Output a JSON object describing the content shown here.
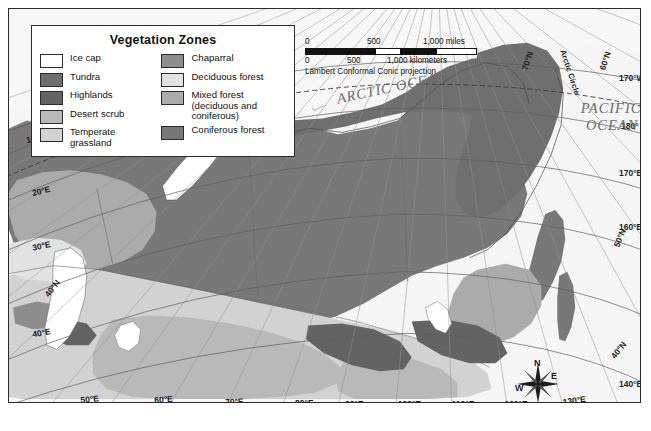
{
  "map": {
    "title": "Vegetation Zones",
    "projection_note": "Lambert Conformal Conic projection",
    "ocean_labels": [
      {
        "name": "arctic-ocean",
        "text": "ARCTIC OCEAN",
        "x": 330,
        "y": 95,
        "rotate": -12
      },
      {
        "name": "pacific-ocean-line1",
        "text": "PACIFIC",
        "x": 604,
        "y": 105,
        "rotate": 0
      },
      {
        "name": "pacific-ocean-line2",
        "text": "OCEAN",
        "x": 605,
        "y": 122,
        "rotate": 0
      }
    ],
    "arctic_circle_label": "Arctic Circle",
    "compass": {
      "north": "N",
      "east": "E",
      "south": "S",
      "west": "W"
    },
    "graticule_labels": [
      {
        "text": "10°E",
        "x": 18,
        "y": 135,
        "rotate": -14
      },
      {
        "text": "20°E",
        "x": 24,
        "y": 188,
        "rotate": -14
      },
      {
        "text": "30°E",
        "x": 24,
        "y": 243,
        "rotate": -12
      },
      {
        "text": "40°E",
        "x": 24,
        "y": 330,
        "rotate": -10
      },
      {
        "text": "40°N",
        "x": 40,
        "y": 290,
        "rotate": -52
      },
      {
        "text": "50°E",
        "x": 72,
        "y": 396,
        "rotate": -6
      },
      {
        "text": "60°E",
        "x": 146,
        "y": 396,
        "rotate": -4
      },
      {
        "text": "70°E",
        "x": 217,
        "y": 398,
        "rotate": -2
      },
      {
        "text": "80°E",
        "x": 287,
        "y": 399,
        "rotate": 0
      },
      {
        "text": "90°E",
        "x": 337,
        "y": 400,
        "rotate": 0
      },
      {
        "text": "100°E",
        "x": 390,
        "y": 400,
        "rotate": 0
      },
      {
        "text": "110°E",
        "x": 444,
        "y": 400,
        "rotate": 0
      },
      {
        "text": "120°E",
        "x": 497,
        "y": 400,
        "rotate": 0
      },
      {
        "text": "130°E",
        "x": 556,
        "y": 398,
        "rotate": -8
      },
      {
        "text": "140°E",
        "x": 612,
        "y": 380,
        "rotate": 0
      },
      {
        "text": "70°N",
        "x": 520,
        "y": 62,
        "rotate": -72
      },
      {
        "text": "170°W",
        "x": 612,
        "y": 72,
        "rotate": 0
      },
      {
        "text": "180°",
        "x": 614,
        "y": 121,
        "rotate": 0
      },
      {
        "text": "170°E",
        "x": 612,
        "y": 168,
        "rotate": 0
      },
      {
        "text": "160°E",
        "x": 612,
        "y": 222,
        "rotate": 0
      },
      {
        "text": "60°N",
        "x": 598,
        "y": 62,
        "rotate": -72
      },
      {
        "text": "50°N",
        "x": 612,
        "y": 240,
        "rotate": -68
      },
      {
        "text": "40°N",
        "x": 608,
        "y": 352,
        "rotate": -52
      }
    ]
  },
  "legend": {
    "title": "Vegetation Zones",
    "left_column": [
      {
        "label": "Ice cap",
        "color": "#ffffff"
      },
      {
        "label": "Tundra",
        "color": "#6f6f6f"
      },
      {
        "label": "Highlands",
        "color": "#636363"
      },
      {
        "label": "Desert scrub",
        "color": "#b9b9b9"
      },
      {
        "label": "Temperate grassland",
        "color": "#d2d2d2"
      }
    ],
    "right_column": [
      {
        "label": "Chaparral",
        "color": "#8d8d8d"
      },
      {
        "label": "Deciduous forest",
        "color": "#e2e2e2"
      },
      {
        "label": "Mixed forest\n(deciduous and coniferous)",
        "color": "#ababab"
      },
      {
        "label": "Coniferous forest",
        "color": "#787878"
      }
    ]
  },
  "scalebar": {
    "miles_ticks": [
      "0",
      "500",
      "1,000 miles"
    ],
    "kilometers_ticks": [
      "0",
      "500",
      "1,000 kilometers"
    ],
    "projection": "Lambert Conformal Conic projection"
  },
  "palette": {
    "ice_cap": "#ffffff",
    "tundra": "#6f6f6f",
    "highlands": "#636363",
    "desert_scrub": "#b9b9b9",
    "temperate_grassland": "#d2d2d2",
    "chaparral": "#8d8d8d",
    "deciduous_forest": "#e2e2e2",
    "mixed_forest": "#ababab",
    "coniferous_forest": "#787878",
    "ocean": "#f5f5f5",
    "frame": "#2b2b2b"
  }
}
